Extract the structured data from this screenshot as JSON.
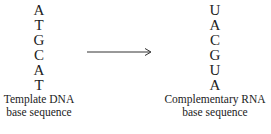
{
  "template": {
    "bases": [
      "A",
      "T",
      "G",
      "C",
      "A",
      "T"
    ],
    "label_line1": "Template DNA",
    "label_line2": "base sequence"
  },
  "complement": {
    "bases": [
      "U",
      "A",
      "C",
      "G",
      "U",
      "A"
    ],
    "label_line1": "Complementary RNA",
    "label_line2": "base sequence"
  },
  "arrow": {
    "direction": "right",
    "color": "#333333"
  }
}
